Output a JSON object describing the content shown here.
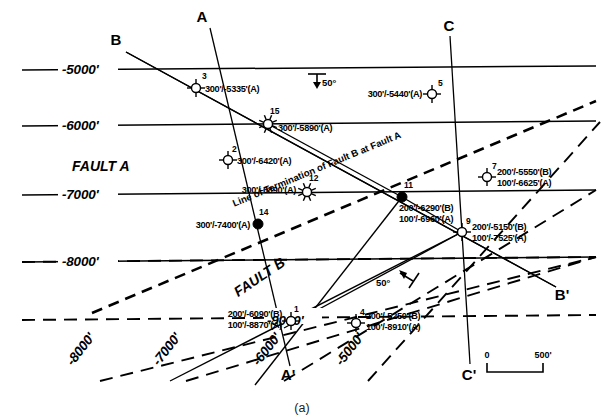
{
  "figure": {
    "caption": "(a)"
  },
  "faults": [
    {
      "name": "FAULT A",
      "x": 72,
      "y": 166,
      "rotate": 0
    },
    {
      "name": "FAULT B",
      "x": 260,
      "y": 278,
      "rotate": -34
    }
  ],
  "termination": {
    "label": "Line of Termination of Fault B at Fault A"
  },
  "contours_solid": [
    {
      "label": "-5000'",
      "label_x": 62,
      "label_y": 74
    },
    {
      "label": "-6000'",
      "label_x": 62,
      "label_y": 129
    },
    {
      "label": "-7000'",
      "label_x": 62,
      "label_y": 198
    },
    {
      "label": "-8000'",
      "label_x": 62,
      "label_y": 265
    }
  ],
  "contours_dashed": [
    {
      "label": "-8000'",
      "label_x": 84,
      "label_y": 352,
      "rotate": -52
    },
    {
      "label": "-7000'",
      "label_x": 170,
      "label_y": 352,
      "rotate": -52
    },
    {
      "label": "-6000'",
      "label_x": 270,
      "label_y": 352,
      "rotate": -52
    },
    {
      "label": "-5000'",
      "label_x": 353,
      "label_y": 352,
      "rotate": -52
    },
    {
      "label": "-9000'",
      "label_x": 270,
      "label_y": 327
    }
  ],
  "cross_sections": [
    {
      "label": "A",
      "x": 202,
      "y": 18
    },
    {
      "label": "A'",
      "x": 288,
      "y": 375
    },
    {
      "label": "B",
      "x": 116,
      "y": 41
    },
    {
      "label": "B'",
      "x": 562,
      "y": 295
    },
    {
      "label": "C",
      "x": 449,
      "y": 27
    },
    {
      "label": "C'",
      "x": 469,
      "y": 375
    }
  ],
  "dip_symbols": [
    {
      "label": "50°",
      "x": 318,
      "y": 80,
      "kind": "strike-dip-down"
    },
    {
      "label": "50°",
      "x": 400,
      "y": 283,
      "kind": "fault-dip-arrow"
    }
  ],
  "scale": {
    "zero": "0",
    "max": "500'"
  },
  "wells": [
    {
      "id": "3",
      "x": 196,
      "y": 88,
      "symbol": "circle-cross",
      "num_dx": 6,
      "num_dy": -9,
      "lines": [
        "300'/-5335'(A)"
      ],
      "label_dx": 9,
      "label_dy": 4,
      "anchor": "start"
    },
    {
      "id": "15",
      "x": 268,
      "y": 124,
      "symbol": "sunburst",
      "num_dx": 2,
      "num_dy": -10,
      "lines": [
        "300'/-5890'(A)"
      ],
      "label_dx": 10,
      "label_dy": 7,
      "anchor": "start"
    },
    {
      "id": "5",
      "x": 432,
      "y": 94,
      "symbol": "circle-cross",
      "num_dx": 6,
      "num_dy": -8,
      "lines": [
        "300'/-5440'(A)"
      ],
      "label_dx": -10,
      "label_dy": 3,
      "anchor": "end"
    },
    {
      "id": "2",
      "x": 228,
      "y": 160,
      "symbol": "circle-cross",
      "num_dx": 4,
      "num_dy": -8,
      "lines": [
        "300'/-6420'(A)"
      ],
      "label_dx": 9,
      "label_dy": 4,
      "anchor": "start"
    },
    {
      "id": "12",
      "x": 307,
      "y": 192,
      "symbol": "sunburst",
      "num_dx": 2,
      "num_dy": -11,
      "lines": [
        "300'/-6890'(A)"
      ],
      "label_dx": -11,
      "label_dy": 1,
      "anchor": "end"
    },
    {
      "id": "7",
      "x": 487,
      "y": 177,
      "symbol": "circle-cross",
      "num_dx": 5,
      "num_dy": -8,
      "lines": [
        "200'/-5550'(B)",
        "100'/-6625'(A)"
      ],
      "label_dx": 10,
      "label_dy": -2,
      "anchor": "start"
    },
    {
      "id": "11",
      "x": 402,
      "y": 197,
      "symbol": "filled",
      "num_dx": 2,
      "num_dy": -9,
      "lines": [
        "200'/-6290'(B)",
        "100'/-6960'(A)"
      ],
      "label_dx": -3,
      "label_dy": 14,
      "anchor": "start"
    },
    {
      "id": "14",
      "x": 258,
      "y": 224,
      "symbol": "filled",
      "num_dx": 1,
      "num_dy": -9,
      "lines": [
        "300'/-7400'(A)"
      ],
      "label_dx": -8,
      "label_dy": 4,
      "anchor": "end"
    },
    {
      "id": "9",
      "x": 462,
      "y": 232,
      "symbol": "circle-cross",
      "num_dx": 4,
      "num_dy": -8,
      "lines": [
        "200'/-5150'(B)",
        "100'/-7525'(A)"
      ],
      "label_dx": 10,
      "label_dy": -2,
      "anchor": "start"
    },
    {
      "id": "1",
      "x": 291,
      "y": 321,
      "symbol": "circle-cross",
      "num_dx": 3,
      "num_dy": -9,
      "lines": [
        "200'/-6090'(B)",
        "100'/-8870'(A)"
      ],
      "label_dx": -9,
      "label_dy": -4,
      "anchor": "end"
    },
    {
      "id": "4",
      "x": 356,
      "y": 323,
      "symbol": "circle-cross",
      "num_dx": 4,
      "num_dy": -8,
      "lines": [
        "200'/-5250'(B)",
        "100'/-8910'(A)"
      ],
      "label_dx": 10,
      "label_dy": -4,
      "anchor": "start"
    }
  ],
  "colors": {
    "line": "#000000",
    "background": "#ffffff",
    "caption": "#222222"
  }
}
